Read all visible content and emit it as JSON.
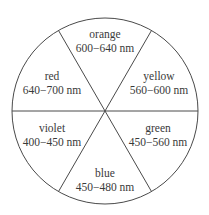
{
  "diagram": {
    "title": "",
    "type": "color-wheel",
    "line_color": "#4a4a4a",
    "text_color": "#3a3a3a",
    "background": "#ffffff",
    "sectors": [
      {
        "name": "orange",
        "range": "600−640 nm"
      },
      {
        "name": "yellow",
        "range": "560−600 nm"
      },
      {
        "name": "green",
        "range": "450−560 nm"
      },
      {
        "name": "blue",
        "range": "450−480 nm"
      },
      {
        "name": "violet",
        "range": "400−450 nm"
      },
      {
        "name": "red",
        "range": "640−700 nm"
      }
    ]
  }
}
